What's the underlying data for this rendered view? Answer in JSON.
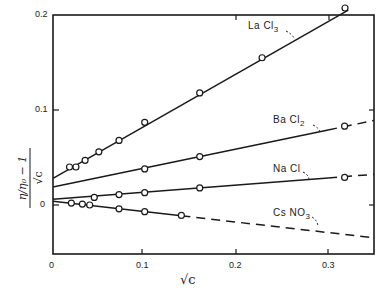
{
  "chart_data": {
    "type": "line",
    "title": "",
    "xlabel": "√c",
    "ylabel": "(η/η₀ − 1)/√c",
    "xlim": [
      0,
      0.35
    ],
    "ylim": [
      -0.05,
      0.2
    ],
    "grid": false,
    "legend": "inline labels",
    "x_ticks": [
      "0",
      "0.1",
      "0.2",
      "0.3"
    ],
    "y_ticks": [
      "0",
      "0.1",
      "0.2"
    ],
    "series": [
      {
        "name": "La Cl3",
        "label_main": "La Cl",
        "label_sub": "3",
        "style": "solid",
        "intercept": 0.028,
        "slope": 0.55,
        "points": [
          [
            0.018,
            0.04
          ],
          [
            0.025,
            0.04
          ],
          [
            0.035,
            0.047
          ],
          [
            0.05,
            0.056
          ],
          [
            0.072,
            0.068
          ],
          [
            0.1,
            0.087
          ],
          [
            0.16,
            0.118
          ],
          [
            0.228,
            0.155
          ],
          [
            0.322,
            0.205
          ]
        ]
      },
      {
        "name": "Ba Cl2",
        "label_main": "Ba Cl",
        "label_sub": "2",
        "style": "solid-then-dashed",
        "intercept": 0.019,
        "slope": 0.2,
        "points": [
          [
            0.1,
            0.038
          ],
          [
            0.16,
            0.051
          ],
          [
            0.318,
            0.083
          ]
        ]
      },
      {
        "name": "Na Cl",
        "label_main": "Na Cl",
        "label_sub": "",
        "style": "solid-then-dashed",
        "intercept": 0.006,
        "slope": 0.075,
        "points": [
          [
            0.045,
            0.008
          ],
          [
            0.072,
            0.011
          ],
          [
            0.1,
            0.013
          ],
          [
            0.16,
            0.018
          ],
          [
            0.318,
            0.029
          ]
        ]
      },
      {
        "name": "Cs NO3",
        "label_main": "Cs NO",
        "label_sub": "3",
        "style": "solid-then-dashed",
        "intercept": 0.004,
        "slope": -0.11,
        "points": [
          [
            0.02,
            0.002
          ],
          [
            0.032,
            0.001
          ],
          [
            0.04,
            0.0
          ],
          [
            0.072,
            -0.004
          ],
          [
            0.1,
            -0.007
          ],
          [
            0.14,
            -0.011
          ]
        ]
      }
    ]
  },
  "axes": {
    "x_tick_0": "0",
    "x_tick_1": "0.1",
    "x_tick_2": "0.2",
    "x_tick_3": "0.3",
    "y_tick_0": "0",
    "y_tick_1": "0.1",
    "y_tick_2": "0.2",
    "xlabel_text": "√c"
  },
  "labels": {
    "lacl3_main": "La Cl",
    "lacl3_sub": "3",
    "bacl2_main": "Ba Cl",
    "bacl2_sub": "2",
    "nacl_main": "Na Cl",
    "csno3_main": "Cs NO",
    "csno3_sub": "3"
  },
  "colors": {
    "ink": "#1a1a1a",
    "background": "#ffffff"
  }
}
